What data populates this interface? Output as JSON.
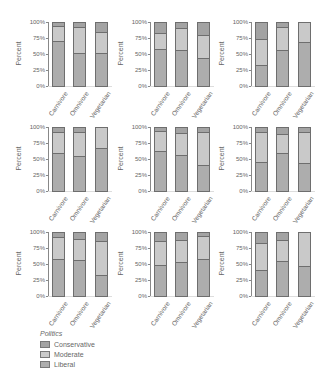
{
  "chart_data": {
    "type": "bar",
    "subtype": "stacked-100-percent",
    "layout": {
      "rows": 3,
      "cols": 3
    },
    "categories": [
      "Carnivore",
      "Omnivore",
      "Vegetarian"
    ],
    "ylabel": "Percent",
    "yticks": [
      "0%",
      "25%",
      "50%",
      "75%",
      "100%"
    ],
    "ylim": [
      0,
      100
    ],
    "legend": {
      "title": "Politics",
      "entries": [
        "Conservative",
        "Moderate",
        "Liberal"
      ],
      "position": "bottom-left"
    },
    "colors": {
      "Conservative": "#a3a3a3",
      "Moderate": "#c9c9c9",
      "Liberal": "#adadad",
      "border": "#6e6e6e"
    },
    "panels": [
      {
        "series": [
          {
            "name": "Liberal",
            "values": [
              70,
              51,
              51
            ]
          },
          {
            "name": "Moderate",
            "values": [
              23,
              41,
              33
            ]
          },
          {
            "name": "Conservative",
            "values": [
              7,
              8,
              16
            ]
          }
        ]
      },
      {
        "series": [
          {
            "name": "Liberal",
            "values": [
              57,
              55,
              43
            ]
          },
          {
            "name": "Moderate",
            "values": [
              26,
              36,
              36
            ]
          },
          {
            "name": "Conservative",
            "values": [
              17,
              9,
              21
            ]
          }
        ]
      },
      {
        "series": [
          {
            "name": "Liberal",
            "values": [
              31,
              55,
              69
            ]
          },
          {
            "name": "Moderate",
            "values": [
              42,
              37,
              31
            ]
          },
          {
            "name": "Conservative",
            "values": [
              27,
              8,
              0
            ]
          }
        ]
      },
      {
        "series": [
          {
            "name": "Liberal",
            "values": [
              59,
              54,
              66
            ]
          },
          {
            "name": "Moderate",
            "values": [
              33,
              38,
              34
            ]
          },
          {
            "name": "Conservative",
            "values": [
              8,
              8,
              0
            ]
          }
        ]
      },
      {
        "series": [
          {
            "name": "Liberal",
            "values": [
              62,
              55,
              39
            ]
          },
          {
            "name": "Moderate",
            "values": [
              31,
              36,
              53
            ]
          },
          {
            "name": "Conservative",
            "values": [
              7,
              9,
              8
            ]
          }
        ]
      },
      {
        "series": [
          {
            "name": "Liberal",
            "values": [
              45,
              58,
              43
            ]
          },
          {
            "name": "Moderate",
            "values": [
              47,
              31,
              49
            ]
          },
          {
            "name": "Conservative",
            "values": [
              8,
              11,
              8
            ]
          }
        ]
      },
      {
        "series": [
          {
            "name": "Liberal",
            "values": [
              57,
              56,
              32
            ]
          },
          {
            "name": "Moderate",
            "values": [
              35,
              33,
              53
            ]
          },
          {
            "name": "Conservative",
            "values": [
              8,
              11,
              15
            ]
          }
        ]
      },
      {
        "series": [
          {
            "name": "Liberal",
            "values": [
              48,
              53,
              57
            ]
          },
          {
            "name": "Moderate",
            "values": [
              37,
              35,
              37
            ]
          },
          {
            "name": "Conservative",
            "values": [
              15,
              12,
              6
            ]
          }
        ]
      },
      {
        "series": [
          {
            "name": "Liberal",
            "values": [
              40,
              54,
              46
            ]
          },
          {
            "name": "Moderate",
            "values": [
              43,
              34,
              54
            ]
          },
          {
            "name": "Conservative",
            "values": [
              17,
              12,
              0
            ]
          }
        ]
      }
    ]
  }
}
